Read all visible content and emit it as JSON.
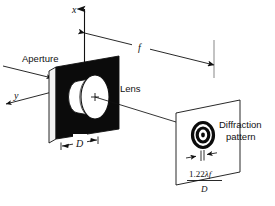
{
  "figure": {
    "type": "optics-diagram",
    "background_color": "#ffffff",
    "ink_color": "#111111",
    "plate_fill_color": "#0b0b0b",
    "lens_fill_color": "#ffffff"
  },
  "axes": {
    "x_label": "x",
    "y_label": "y",
    "x_arrow": "up-arrow-icon",
    "y_arrow": "down-left-arrow-icon"
  },
  "labels": {
    "aperture": "Aperture",
    "lens": "Lens",
    "diffraction_line1": "Diffraction",
    "diffraction_line2": "pattern"
  },
  "dimensions": {
    "focal_length_symbol": "f",
    "aperture_diameter_symbol": "D",
    "airy_width_numerator": "1.22λf",
    "airy_width_numerator_number": "1.22",
    "airy_width_numerator_lambda": "λ",
    "airy_width_numerator_f": "f",
    "airy_width_denominator": "D"
  },
  "elements": {
    "incoming_ray": "incoming-plane-wave-ray",
    "optical_axis": "optical-axis-line",
    "lens_center_mark": "plus-center-mark",
    "airy_rings_count": 3
  },
  "caption_ghost": "Figure caption partially cut off at bottom edge"
}
